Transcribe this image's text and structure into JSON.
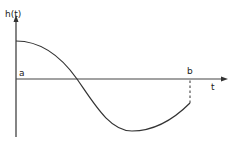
{
  "diagram": {
    "y_axis_label": "h(t)",
    "x_axis_label": "t",
    "origin_label": "a",
    "end_label": "b",
    "colors": {
      "stroke": "#333333",
      "background": "#ffffff"
    }
  }
}
